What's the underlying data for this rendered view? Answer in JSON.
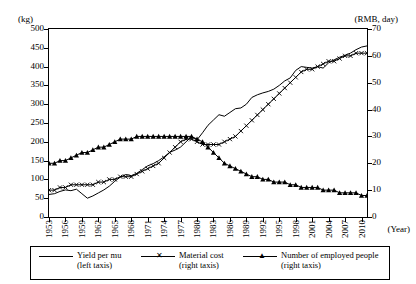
{
  "chart_data": {
    "type": "line",
    "title": "",
    "xlabel": "(Year)",
    "ylabel_left": "(kg)",
    "ylabel_right": "(RMB, day)",
    "x_tick_labels": [
      "1953",
      "1956",
      "1959",
      "1962",
      "1965",
      "1968",
      "1971",
      "1974",
      "1977",
      "1980",
      "1983",
      "1986",
      "1989",
      "1992",
      "1995",
      "1998",
      "2001",
      "2004",
      "2007",
      "2010"
    ],
    "x_range": [
      1953,
      2011
    ],
    "ylim_left": [
      0,
      500
    ],
    "ylim_right": [
      0,
      70
    ],
    "y_ticks_left": [
      "0",
      "50",
      "100",
      "150",
      "200",
      "250",
      "300",
      "350",
      "400",
      "450",
      "500"
    ],
    "y_ticks_right": [
      "0",
      "10",
      "20",
      "30",
      "40",
      "50",
      "60",
      "70"
    ],
    "grid": false,
    "legend_position": "bottom",
    "series": [
      {
        "name": "Yield per mu",
        "axis": "left taxis",
        "marker": "none",
        "x": [
          1953,
          1954,
          1955,
          1956,
          1957,
          1958,
          1959,
          1960,
          1961,
          1962,
          1963,
          1964,
          1965,
          1966,
          1967,
          1968,
          1969,
          1970,
          1971,
          1972,
          1973,
          1974,
          1975,
          1976,
          1977,
          1978,
          1979,
          1980,
          1981,
          1982,
          1983,
          1984,
          1985,
          1986,
          1987,
          1988,
          1989,
          1990,
          1991,
          1992,
          1993,
          1994,
          1995,
          1996,
          1997,
          1998,
          1999,
          2000,
          2001,
          2002,
          2003,
          2004,
          2005,
          2006,
          2007,
          2008,
          2009,
          2010,
          2011
        ],
        "values": [
          60,
          62,
          68,
          72,
          70,
          74,
          62,
          50,
          56,
          64,
          72,
          82,
          95,
          106,
          113,
          110,
          116,
          126,
          136,
          142,
          150,
          160,
          172,
          178,
          186,
          200,
          214,
          205,
          224,
          244,
          258,
          272,
          268,
          278,
          288,
          290,
          300,
          318,
          325,
          330,
          334,
          340,
          350,
          362,
          370,
          390,
          400,
          398,
          396,
          400,
          396,
          410,
          418,
          425,
          430,
          436,
          445,
          452,
          455
        ]
      },
      {
        "name": "Material cost",
        "axis": "right taxis",
        "marker": "x",
        "x": [
          1953,
          1954,
          1955,
          1956,
          1957,
          1958,
          1959,
          1960,
          1961,
          1962,
          1963,
          1964,
          1965,
          1966,
          1967,
          1968,
          1969,
          1970,
          1971,
          1972,
          1973,
          1974,
          1975,
          1976,
          1977,
          1978,
          1979,
          1980,
          1981,
          1982,
          1983,
          1984,
          1985,
          1986,
          1987,
          1988,
          1989,
          1990,
          1991,
          1992,
          1993,
          1994,
          1995,
          1996,
          1997,
          1998,
          1999,
          2000,
          2001,
          2002,
          2003,
          2004,
          2005,
          2006,
          2007,
          2008,
          2009,
          2010,
          2011
        ],
        "values": [
          10,
          10,
          11,
          11,
          12,
          12,
          12,
          12,
          12,
          13,
          13,
          14,
          14,
          15,
          15,
          15,
          16,
          17,
          18,
          19,
          20,
          22,
          24,
          26,
          28,
          29,
          29,
          28,
          27,
          27,
          27,
          27,
          28,
          29,
          30,
          32,
          34,
          36,
          38,
          40,
          42,
          44,
          46,
          48,
          50,
          52,
          54,
          55,
          55,
          56,
          57,
          58,
          58,
          59,
          60,
          60,
          61,
          61,
          61
        ]
      },
      {
        "name": "Number of employed people",
        "axis": "right taxis",
        "marker": "triangle",
        "x": [
          1953,
          1954,
          1955,
          1956,
          1957,
          1958,
          1959,
          1960,
          1961,
          1962,
          1963,
          1964,
          1965,
          1966,
          1967,
          1968,
          1969,
          1970,
          1971,
          1972,
          1973,
          1974,
          1975,
          1976,
          1977,
          1978,
          1979,
          1980,
          1981,
          1982,
          1983,
          1984,
          1985,
          1986,
          1987,
          1988,
          1989,
          1990,
          1991,
          1992,
          1993,
          1994,
          1995,
          1996,
          1997,
          1998,
          1999,
          2000,
          2001,
          2002,
          2003,
          2004,
          2005,
          2006,
          2007,
          2008,
          2009,
          2010,
          2011
        ],
        "values": [
          20,
          20,
          21,
          21,
          22,
          23,
          24,
          24,
          25,
          26,
          26,
          27,
          28,
          29,
          29,
          29,
          30,
          30,
          30,
          30,
          30,
          30,
          30,
          30,
          30,
          30,
          30,
          29,
          28,
          26,
          24,
          22,
          20,
          19,
          18,
          17,
          16,
          15,
          15,
          14,
          14,
          13,
          13,
          13,
          12,
          12,
          11,
          11,
          11,
          11,
          10,
          10,
          10,
          9,
          9,
          9,
          9,
          8,
          8
        ]
      }
    ]
  },
  "legend": {
    "items": [
      {
        "label_line1": "Yield per mu",
        "label_line2": "(left taxis)",
        "marker": "line"
      },
      {
        "label_line1": "Material cost",
        "label_line2": "(right taxis)",
        "marker": "x"
      },
      {
        "label_line1": "Number of employed people",
        "label_line2": "(right taxis)",
        "marker": "triangle"
      }
    ]
  }
}
